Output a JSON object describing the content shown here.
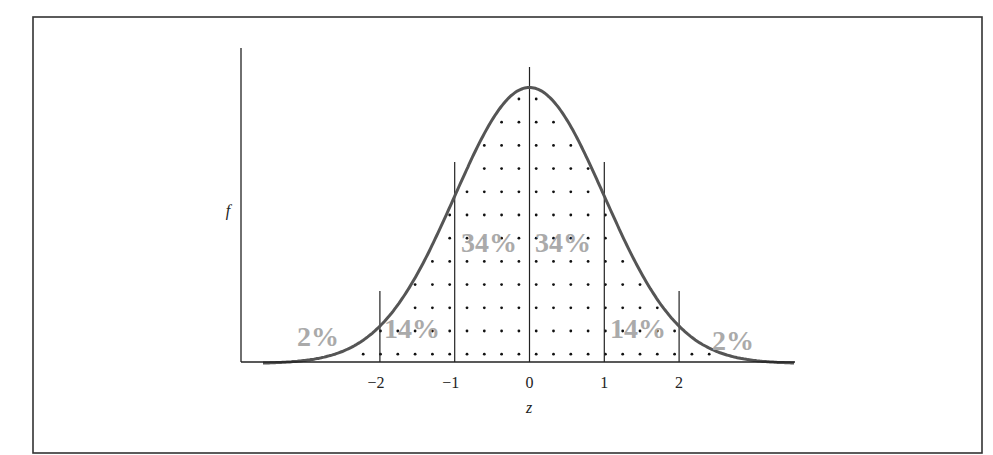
{
  "chart_data": {
    "type": "area",
    "title": "",
    "subtitle": "",
    "xlabel": "z",
    "ylabel": "f",
    "distribution": "standard normal",
    "x_ticks": [
      -2,
      -1,
      0,
      1,
      2
    ],
    "x_tick_labels": [
      "−2",
      "−1",
      "0",
      "1",
      "2"
    ],
    "xlim": [
      -3.6,
      3.6
    ],
    "grid": false,
    "legend": "none",
    "sd_lines": [
      -2,
      -1,
      0,
      1,
      2
    ],
    "regions": [
      {
        "from": "-inf",
        "to": -2,
        "label": "2%",
        "percent": 2
      },
      {
        "from": -2,
        "to": -1,
        "label": "14%",
        "percent": 14
      },
      {
        "from": -1,
        "to": 0,
        "label": "34%",
        "percent": 34
      },
      {
        "from": 0,
        "to": 1,
        "label": "34%",
        "percent": 34
      },
      {
        "from": 1,
        "to": 2,
        "label": "14%",
        "percent": 14
      },
      {
        "from": 2,
        "to": "inf",
        "label": "2%",
        "percent": 2
      }
    ],
    "fill_pattern": "dotted",
    "colors": {
      "curve": "#555555",
      "labels": "#aaaaaa",
      "lines": "#222222"
    }
  },
  "layout": {
    "frame": {
      "x": 33,
      "y": 17,
      "w": 949,
      "h": 436
    },
    "y_axis": {
      "x": 241,
      "top": 48,
      "bottom": 362
    },
    "baseline": {
      "y": 362,
      "x1": 241,
      "x2": 795
    },
    "origin_x": 529.5,
    "px_per_sd": 74.8,
    "peak_y": 86,
    "sd_line_tops": {
      "0": 67,
      "1": 162,
      "2": 291
    },
    "dots": {
      "x0": 467,
      "dx": 17.3,
      "y0": 99,
      "dy": 23.2,
      "rows": 12
    },
    "label_positions": [
      {
        "x": 318,
        "y": 346
      },
      {
        "x": 412,
        "y": 338
      },
      {
        "x": 489,
        "y": 252
      },
      {
        "x": 563,
        "y": 252
      },
      {
        "x": 638,
        "y": 338
      },
      {
        "x": 733,
        "y": 350
      }
    ],
    "ylabel_pos": {
      "x": 228,
      "y": 216
    },
    "xlabel_pos": {
      "x": 529,
      "y": 413
    },
    "tick_label_y": 388
  }
}
